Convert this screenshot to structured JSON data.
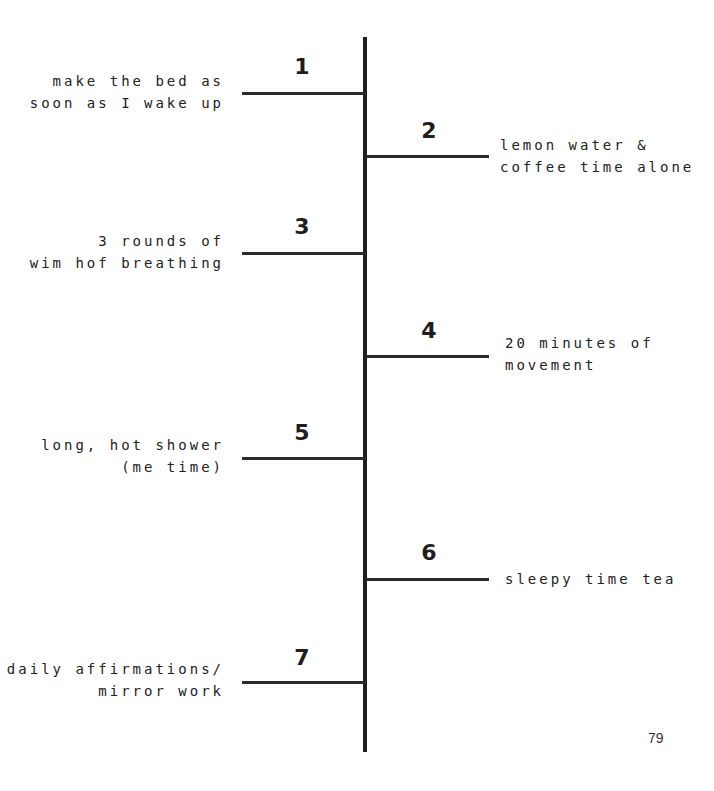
{
  "timeline": {
    "title": "",
    "steps": [
      {
        "number": "1",
        "side": "left",
        "lines": [
          "make the bed as",
          "soon as I wake up"
        ]
      },
      {
        "number": "2",
        "side": "right",
        "lines": [
          "lemon water &",
          "coffee time alone"
        ]
      },
      {
        "number": "3",
        "side": "left",
        "lines": [
          "3 rounds of",
          "wim hof breathing"
        ]
      },
      {
        "number": "4",
        "side": "right",
        "lines": [
          "20 minutes of",
          "movement"
        ]
      },
      {
        "number": "5",
        "side": "left",
        "lines": [
          "long, hot shower",
          "(me time)"
        ]
      },
      {
        "number": "6",
        "side": "right",
        "lines": [
          "sleepy time tea"
        ]
      },
      {
        "number": "7",
        "side": "left",
        "lines": [
          "daily affirmations/",
          "mirror work"
        ]
      }
    ]
  },
  "page_number": "79"
}
